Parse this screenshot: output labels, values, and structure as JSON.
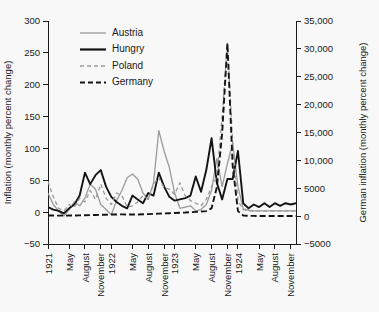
{
  "chart_data": {
    "type": "line",
    "title": "",
    "xlabel": "",
    "ylabel": "Inflation (monthly percent change)",
    "y2label": "German inflation (monthly percent change)",
    "ylim": [
      -50,
      300
    ],
    "y2lim": [
      -5000,
      35000
    ],
    "yticks": [
      -50,
      0,
      50,
      100,
      150,
      200,
      250,
      300
    ],
    "ytick_labels": [
      "−50",
      "0",
      "50",
      "100",
      "150",
      "200",
      "250",
      "300"
    ],
    "y2ticks": [
      -5000,
      0,
      5000,
      10000,
      15000,
      20000,
      25000,
      30000,
      35000
    ],
    "y2tick_labels": [
      "−5000",
      "0",
      "5000",
      "10,000",
      "15,000",
      "20,000",
      "25,000",
      "30,000",
      "35,000"
    ],
    "grid": false,
    "legend_position": "top-left",
    "categories": [
      "1921",
      "Feb",
      "Mar",
      "Apr",
      "May",
      "Jun",
      "Jul",
      "August",
      "Sep",
      "Oct",
      "November",
      "Dec",
      "1922",
      "Feb",
      "Mar",
      "Apr",
      "May",
      "Jun",
      "Jul",
      "August",
      "Sep",
      "Oct",
      "November",
      "Dec",
      "1923",
      "Feb",
      "Mar",
      "Apr",
      "May",
      "Jun",
      "Jul",
      "August",
      "Sep",
      "Oct",
      "November",
      "Dec",
      "1924",
      "Feb",
      "Mar",
      "Apr",
      "May",
      "Jun",
      "Jul",
      "August",
      "Sep",
      "Oct",
      "November",
      "Dec"
    ],
    "xtick_indices": [
      0,
      4,
      7,
      10,
      12,
      16,
      19,
      22,
      24,
      28,
      31,
      34,
      36,
      40,
      43,
      46
    ],
    "xtick_labels": [
      "1921",
      "May",
      "August",
      "November",
      "1922",
      "May",
      "August",
      "November",
      "1923",
      "May",
      "August",
      "November",
      "1924",
      "May",
      "August",
      "November"
    ],
    "series": [
      {
        "name": "Austria",
        "color": "#9a9a9a",
        "dash": "none",
        "width": 1.3,
        "axis": "left",
        "values": [
          30,
          12,
          2,
          -6,
          4,
          16,
          10,
          22,
          44,
          36,
          12,
          4,
          -4,
          18,
          34,
          54,
          60,
          52,
          30,
          20,
          46,
          128,
          96,
          70,
          30,
          6,
          8,
          10,
          2,
          4,
          12,
          34,
          84,
          40,
          76,
          108,
          40,
          5,
          3,
          2,
          2,
          2,
          2,
          2,
          2,
          2,
          2,
          2
        ]
      },
      {
        "name": "Hungry",
        "color": "#141414",
        "dash": "none",
        "width": 1.9,
        "axis": "left",
        "values": [
          8,
          4,
          2,
          -2,
          6,
          12,
          26,
          62,
          44,
          58,
          66,
          40,
          24,
          16,
          10,
          6,
          26,
          20,
          14,
          30,
          26,
          62,
          40,
          24,
          18,
          20,
          22,
          26,
          56,
          32,
          66,
          116,
          46,
          20,
          52,
          52,
          96,
          14,
          6,
          12,
          8,
          14,
          8,
          14,
          10,
          14,
          12,
          14
        ]
      },
      {
        "name": "Poland",
        "color": "#9a9a9a",
        "dash": "4,3",
        "width": 1.3,
        "axis": "left",
        "values": [
          48,
          24,
          6,
          2,
          12,
          8,
          22,
          16,
          34,
          20,
          44,
          22,
          12,
          30,
          26,
          8,
          10,
          16,
          26,
          20,
          44,
          54,
          38,
          36,
          28,
          46,
          26,
          18,
          14,
          10,
          20,
          40,
          56,
          150,
          266,
          110,
          18,
          4,
          2,
          2,
          2,
          2,
          2,
          2,
          2,
          2,
          2,
          2
        ]
      },
      {
        "name": "Germany",
        "color": "#141414",
        "dash": "6,3",
        "width": 1.9,
        "axis": "right",
        "values": [
          120,
          100,
          90,
          80,
          100,
          120,
          140,
          160,
          180,
          200,
          240,
          260,
          280,
          300,
          320,
          300,
          280,
          300,
          340,
          360,
          400,
          440,
          480,
          520,
          560,
          600,
          640,
          700,
          760,
          820,
          900,
          1400,
          5200,
          14800,
          31000,
          9000,
          900,
          100,
          60,
          40,
          30,
          25,
          20,
          18,
          16,
          15,
          14,
          12
        ]
      }
    ],
    "legend_entries": [
      {
        "label": "Austria",
        "color": "#9a9a9a",
        "dash": "none",
        "width": 1.3
      },
      {
        "label": "Hungry",
        "color": "#141414",
        "dash": "none",
        "width": 2.2
      },
      {
        "label": "Poland",
        "color": "#9a9a9a",
        "dash": "4,3",
        "width": 1.4
      },
      {
        "label": "Germany",
        "color": "#141414",
        "dash": "5,3",
        "width": 2.2
      }
    ]
  }
}
